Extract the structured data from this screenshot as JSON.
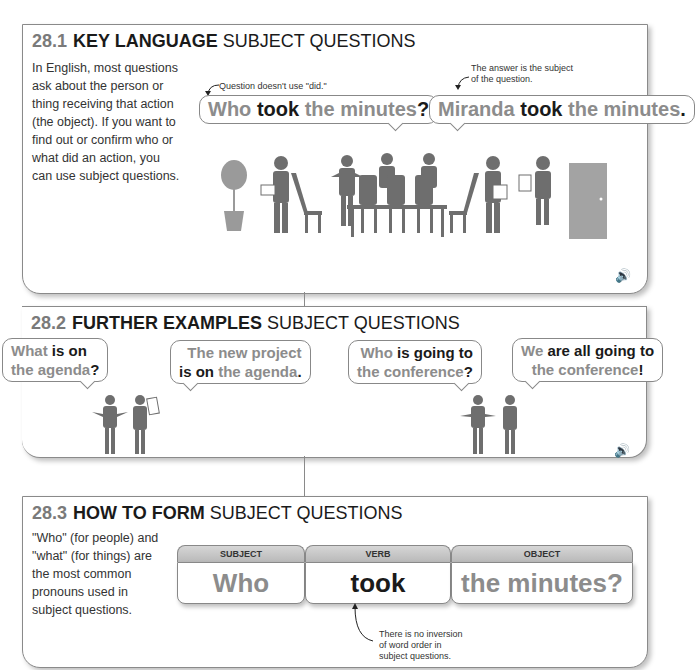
{
  "section1": {
    "number": "28.1",
    "key": "KEY LANGUAGE",
    "rest": "SUBJECT QUESTIONS",
    "description": "In English, most questions ask about the person or thing receiving that action (the object). If you want to find out or confirm who or what did an action, you can use subject questions.",
    "note_left": "Question doesn't use \"did.\"",
    "note_right_1": "The answer is the subject",
    "note_right_2": "of the question.",
    "bubble_left": {
      "p1": "Who ",
      "p2": "took",
      "p3": " the minutes",
      "p4": "?"
    },
    "bubble_right": {
      "p1": "Miranda ",
      "p2": "took",
      "p3": " the minutes",
      "p4": "."
    },
    "audio_icon": "speaker-icon"
  },
  "section2": {
    "number": "28.2",
    "key": "FURTHER EXAMPLES",
    "rest": "SUBJECT QUESTIONS",
    "bubble1": {
      "l1a": "What ",
      "l1b": "is on",
      "l2a": "the agenda",
      "l2b": "?"
    },
    "bubble2": {
      "l1": "The new project",
      "l2a": "is on",
      "l2b": " the agenda",
      "l2c": "."
    },
    "bubble3": {
      "l1a": "Who ",
      "l1b": "is going to",
      "l2a": "the conference",
      "l2b": "?"
    },
    "bubble4": {
      "l1a": "We ",
      "l1b": "are all going  to",
      "l2a": "the conference",
      "l2b": "!"
    },
    "audio_icon": "speaker-icon"
  },
  "section3": {
    "number": "28.3",
    "key": "HOW TO FORM",
    "rest": "SUBJECT QUESTIONS",
    "description": "\"Who\" (for people) and \"what\" (for things) are the most common pronouns used in subject questions.",
    "pieces": [
      {
        "label": "SUBJECT",
        "word": "Who"
      },
      {
        "label": "VERB",
        "word": "took"
      },
      {
        "label": "OBJECT",
        "word": "the minutes?"
      }
    ],
    "note_1": "There is no inversion",
    "note_2": "of word order in",
    "note_3": "subject questions."
  },
  "colors": {
    "number": "#7a7a7a",
    "grey_text": "#8c8c8c",
    "dark_text": "#1a1a1a",
    "border": "#8a8a8a",
    "figure": "#6e6e6e"
  }
}
